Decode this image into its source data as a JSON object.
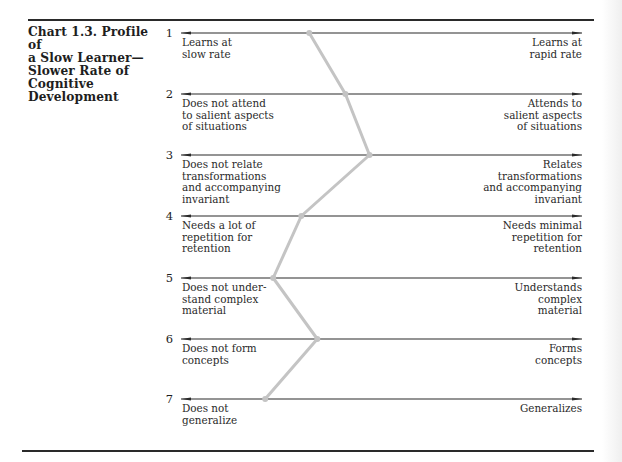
{
  "title_lines": [
    "Chart 1.3.  Profile of",
    "a Slow Learner—",
    "Slower Rate of",
    "Cognitive",
    "Development"
  ],
  "items": [
    {
      "number": "1",
      "left": [
        "Learns at",
        "slow rate"
      ],
      "right": [
        "Learns at",
        "rapid rate"
      ]
    },
    {
      "number": "2",
      "left": [
        "Does not attend",
        "to salient aspects",
        "of situations"
      ],
      "right": [
        "Attends to",
        "salient aspects",
        "of situations"
      ]
    },
    {
      "number": "3",
      "left": [
        "Does not relate",
        "transformations",
        "and accompanying",
        "invariant"
      ],
      "right": [
        "Relates",
        "transformations",
        "and accompanying",
        "invariant"
      ]
    },
    {
      "number": "4",
      "left": [
        "Needs a lot of",
        "repetition for",
        "retention"
      ],
      "right": [
        "Needs minimal",
        "repetition for",
        "retention"
      ]
    },
    {
      "number": "5",
      "left": [
        "Does not under-",
        "stand complex",
        "material"
      ],
      "right": [
        "Understands",
        "complex",
        "material"
      ]
    },
    {
      "number": "6",
      "left": [
        "Does not form",
        "concepts"
      ],
      "right": [
        "Forms",
        "concepts"
      ]
    },
    {
      "number": "7",
      "left": [
        "Does not",
        "generalize"
      ],
      "right": [
        "Generalizes"
      ]
    }
  ],
  "colors": {
    "profile_line": "#c4c4c4",
    "axis": "#2a2a2a"
  },
  "chart_data": {
    "type": "line",
    "orientation": "horizontal bipolar scales (profile)",
    "scale_range": [
      0,
      100
    ],
    "scale_note": "0 = left pole (slow/deficit), 100 = right pole (advanced); values estimated from marker position along each arrow",
    "categories": [
      "1",
      "2",
      "3",
      "4",
      "5",
      "6",
      "7"
    ],
    "left_poles": [
      "Learns at slow rate",
      "Does not attend to salient aspects of situations",
      "Does not relate transformations and accompanying invariant",
      "Needs a lot of repetition for retention",
      "Does not understand complex material",
      "Does not form concepts",
      "Does not generalize"
    ],
    "right_poles": [
      "Learns at rapid rate",
      "Attends to salient aspects of situations",
      "Relates transformations and accompanying invariant",
      "Needs minimal repetition for retention",
      "Understands complex material",
      "Forms concepts",
      "Generalizes"
    ],
    "series": [
      {
        "name": "Slow learner profile",
        "values": [
          32,
          41,
          47,
          30,
          23,
          34,
          21
        ]
      }
    ],
    "grid": false,
    "legend": "none"
  }
}
